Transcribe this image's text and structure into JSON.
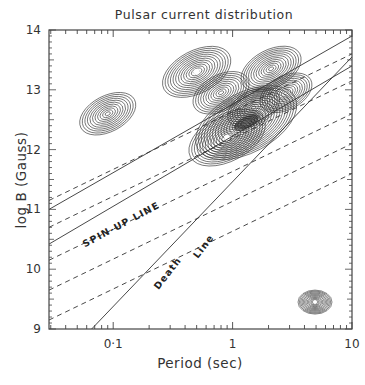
{
  "chart_data": {
    "type": "line",
    "title": "Pulsar current distribution",
    "xlabel": "Period (sec)",
    "ylabel": "log B (Gauss)",
    "xscale": "log",
    "xlim": [
      0.029,
      10
    ],
    "ylim": [
      9,
      14
    ],
    "xticks": [
      {
        "value": 0.1,
        "label": "0·1"
      },
      {
        "value": 1,
        "label": "1"
      },
      {
        "value": 10,
        "label": "10"
      }
    ],
    "yticks": [
      {
        "value": 9,
        "label": "9"
      },
      {
        "value": 10,
        "label": "10"
      },
      {
        "value": 11,
        "label": "11"
      },
      {
        "value": 12,
        "label": "12"
      },
      {
        "value": 13,
        "label": "13"
      },
      {
        "value": 14,
        "label": "14"
      }
    ],
    "grid": false,
    "annotations": [
      {
        "text": "SPIN-UP LINE",
        "x": 0.12,
        "y": 10.7
      },
      {
        "text": "Death",
        "x": 0.3,
        "y": 9.9
      },
      {
        "text": "Line",
        "x": 0.6,
        "y": 10.35
      }
    ],
    "series": [
      {
        "name": "spin-up-solid-1",
        "style": "solid",
        "x": [
          0.029,
          10
        ],
        "y": [
          11.0,
          13.9
        ]
      },
      {
        "name": "spin-up-solid-2",
        "style": "solid",
        "x": [
          0.029,
          10
        ],
        "y": [
          10.42,
          13.4
        ]
      },
      {
        "name": "death-line",
        "style": "solid",
        "x": [
          0.066,
          10
        ],
        "y": [
          9.0,
          13.55
        ]
      },
      {
        "name": "dashed-1",
        "style": "dashed",
        "x": [
          0.029,
          10
        ],
        "y": [
          11.15,
          13.6
        ]
      },
      {
        "name": "dashed-2",
        "style": "dashed",
        "x": [
          0.029,
          10
        ],
        "y": [
          10.7,
          13.15
        ]
      },
      {
        "name": "dashed-3",
        "style": "dashed",
        "x": [
          0.029,
          10
        ],
        "y": [
          10.15,
          12.6
        ]
      },
      {
        "name": "dashed-4",
        "style": "dashed",
        "x": [
          0.029,
          10
        ],
        "y": [
          9.65,
          12.1
        ]
      },
      {
        "name": "dashed-5",
        "style": "dashed",
        "x": [
          0.029,
          10
        ],
        "y": [
          9.15,
          11.6
        ]
      }
    ],
    "contour_peaks": [
      {
        "x": 1.3,
        "y": 12.45,
        "strength": 1.0
      },
      {
        "x": 0.9,
        "y": 12.2,
        "strength": 0.7
      },
      {
        "x": 0.5,
        "y": 13.3,
        "strength": 0.6
      },
      {
        "x": 0.8,
        "y": 12.95,
        "strength": 0.45
      },
      {
        "x": 2.1,
        "y": 13.35,
        "strength": 0.5
      },
      {
        "x": 1.5,
        "y": 12.7,
        "strength": 0.4
      },
      {
        "x": 2.8,
        "y": 12.95,
        "strength": 0.4
      },
      {
        "x": 0.09,
        "y": 12.6,
        "strength": 0.45
      },
      {
        "x": 4.9,
        "y": 9.45,
        "strength": 0.55
      }
    ]
  }
}
